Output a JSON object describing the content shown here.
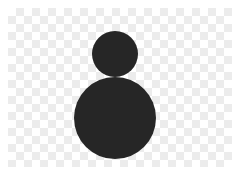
{
  "image": {
    "description": "Two stacked black circles on a transparency checkerboard",
    "background": {
      "type": "checkerboard",
      "light": "#ffffff",
      "dark": "#ececec",
      "cell": 8
    },
    "shapes": [
      {
        "name": "head-circle",
        "cx": 115,
        "cy": 54,
        "r": 23,
        "fill": "#262626"
      },
      {
        "name": "body-circle",
        "cx": 115,
        "cy": 118,
        "r": 41,
        "fill": "#262626"
      }
    ]
  }
}
